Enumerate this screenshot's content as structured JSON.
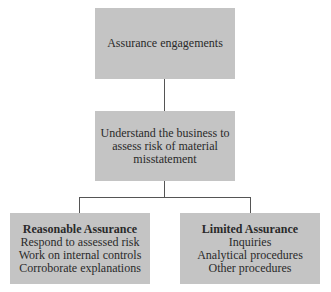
{
  "diagram": {
    "type": "flowchart",
    "nodes": {
      "top": {
        "text": "Assurance engagements"
      },
      "middle": {
        "lines": [
          "Understand the business to",
          "assess risk of material",
          "misstatement"
        ]
      },
      "left": {
        "title": "Reasonable Assurance",
        "lines": [
          "Respond to assessed risk",
          "Work on internal controls",
          "Corroborate explanations"
        ]
      },
      "right": {
        "title": "Limited Assurance",
        "lines": [
          "Inquiries",
          "Analytical procedures",
          "Other procedures"
        ]
      }
    },
    "edges": [
      [
        "top",
        "middle"
      ],
      [
        "middle",
        "left"
      ],
      [
        "middle",
        "right"
      ]
    ],
    "colors": {
      "box_fill": "#c4c4c4",
      "line": "#555555",
      "text": "#2a2a2a"
    }
  }
}
